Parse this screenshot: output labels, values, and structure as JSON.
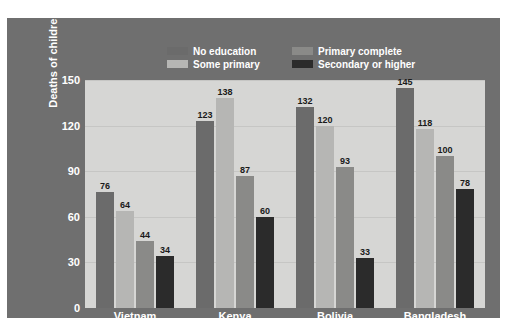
{
  "colors": {
    "panel_bg": "#6f6f6f",
    "plot_bg": "#d6d6d4",
    "gridline": "#c6c6c4",
    "axis_text": "#ffffff",
    "value_text": "#1a1a1a",
    "no_education": "#6b6b6b",
    "some_primary": "#b6b6b4",
    "primary_complete": "#8a8a88",
    "secondary_or_higher": "#2b2b2b"
  },
  "legend": {
    "items": [
      {
        "label": "No education",
        "color": "#6b6b6b",
        "swatch": "legend-swatch-no-education"
      },
      {
        "label": "Some primary",
        "color": "#b6b6b4",
        "swatch": "legend-swatch-some-primary"
      },
      {
        "label": "Primary complete",
        "color": "#8a8a88",
        "swatch": "legend-swatch-primary-complete"
      },
      {
        "label": "Secondary or higher",
        "color": "#2b2b2b",
        "swatch": "legend-swatch-secondary-or-higher"
      }
    ]
  },
  "chart_data": {
    "type": "bar",
    "title": "",
    "xlabel": "",
    "ylabel": "Deaths of children under age 5 per 1,000 births",
    "ylim": [
      0,
      150
    ],
    "yticks": [
      150,
      120,
      90,
      60,
      30,
      0
    ],
    "grid": true,
    "legend_position": "top",
    "categories": [
      "Vietnam",
      "Kenya",
      "Bolivia",
      "Bangladesh"
    ],
    "series": [
      {
        "name": "No education",
        "color": "#6b6b6b",
        "values": [
          76,
          123,
          132,
          145
        ]
      },
      {
        "name": "Some primary",
        "color": "#b6b6b4",
        "values": [
          64,
          138,
          120,
          118
        ]
      },
      {
        "name": "Primary complete",
        "color": "#8a8a88",
        "values": [
          44,
          87,
          93,
          100
        ]
      },
      {
        "name": "Secondary or higher",
        "color": "#2b2b2b",
        "values": [
          34,
          60,
          33,
          78
        ]
      }
    ]
  }
}
